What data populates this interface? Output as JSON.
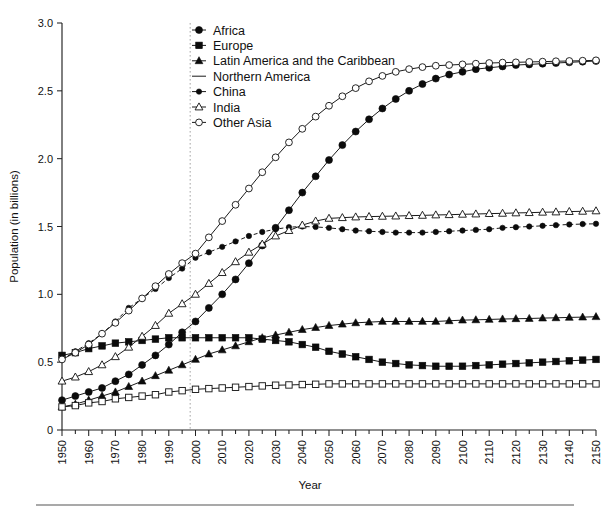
{
  "chart_data": {
    "type": "line",
    "title": "",
    "xlabel": "Year",
    "ylabel": "Population  (in billions)",
    "xlim": [
      1950,
      2150
    ],
    "ylim": [
      0,
      3.0
    ],
    "yticks": [
      "0",
      "0.5",
      "1.0",
      "1.5",
      "2.0",
      "2.5",
      "3.0"
    ],
    "ytick_values": [
      0,
      0.5,
      1.0,
      1.5,
      2.0,
      2.5,
      3.0
    ],
    "xticks": [
      "1950",
      "1960",
      "1970",
      "1980",
      "1990",
      "2000",
      "2010",
      "2020",
      "2030",
      "2040",
      "2050",
      "2060",
      "2070",
      "2080",
      "2090",
      "2100",
      "2110",
      "2120",
      "2130",
      "2140",
      "2150"
    ],
    "xtick_values": [
      1950,
      1960,
      1970,
      1980,
      1990,
      2000,
      2010,
      2020,
      2030,
      2040,
      2050,
      2060,
      2070,
      2080,
      2090,
      2100,
      2110,
      2120,
      2130,
      2140,
      2150
    ],
    "grid": false,
    "legend_position": "top-center",
    "annotations": [
      {
        "name": "projection-divider",
        "type": "vline",
        "x": 1998,
        "style": "dotted"
      }
    ],
    "x": [
      1950,
      1955,
      1960,
      1965,
      1970,
      1975,
      1980,
      1985,
      1990,
      1995,
      2000,
      2005,
      2010,
      2015,
      2020,
      2025,
      2030,
      2035,
      2040,
      2045,
      2050,
      2055,
      2060,
      2065,
      2070,
      2075,
      2080,
      2085,
      2090,
      2095,
      2100,
      2105,
      2110,
      2115,
      2120,
      2125,
      2130,
      2135,
      2140,
      2145,
      2150
    ],
    "series": [
      {
        "name": "Africa",
        "marker": "filled-circle",
        "line": "solid",
        "values": [
          0.22,
          0.25,
          0.28,
          0.31,
          0.36,
          0.41,
          0.48,
          0.55,
          0.63,
          0.72,
          0.8,
          0.9,
          1.0,
          1.11,
          1.23,
          1.36,
          1.49,
          1.62,
          1.75,
          1.87,
          1.99,
          2.1,
          2.2,
          2.29,
          2.37,
          2.44,
          2.5,
          2.55,
          2.59,
          2.62,
          2.64,
          2.66,
          2.67,
          2.68,
          2.69,
          2.695,
          2.7,
          2.705,
          2.71,
          2.715,
          2.72
        ]
      },
      {
        "name": "Europe",
        "marker": "filled-square",
        "line": "solid",
        "values": [
          0.55,
          0.57,
          0.6,
          0.62,
          0.64,
          0.65,
          0.66,
          0.67,
          0.68,
          0.68,
          0.68,
          0.68,
          0.68,
          0.68,
          0.68,
          0.67,
          0.66,
          0.65,
          0.63,
          0.61,
          0.58,
          0.56,
          0.54,
          0.52,
          0.5,
          0.49,
          0.48,
          0.475,
          0.47,
          0.47,
          0.47,
          0.475,
          0.48,
          0.485,
          0.49,
          0.495,
          0.5,
          0.505,
          0.51,
          0.515,
          0.52
        ]
      },
      {
        "name": "Latin America and the Caribbean",
        "marker": "filled-triangle",
        "line": "solid",
        "values": [
          0.17,
          0.19,
          0.22,
          0.25,
          0.28,
          0.32,
          0.36,
          0.4,
          0.44,
          0.48,
          0.52,
          0.56,
          0.59,
          0.62,
          0.65,
          0.68,
          0.7,
          0.72,
          0.74,
          0.755,
          0.77,
          0.78,
          0.79,
          0.795,
          0.8,
          0.8,
          0.8,
          0.8,
          0.8,
          0.805,
          0.81,
          0.812,
          0.815,
          0.818,
          0.82,
          0.822,
          0.825,
          0.827,
          0.83,
          0.832,
          0.835
        ]
      },
      {
        "name": "Northern America",
        "marker": "open-square",
        "line": "solid",
        "values": [
          0.17,
          0.18,
          0.2,
          0.21,
          0.23,
          0.24,
          0.25,
          0.26,
          0.28,
          0.29,
          0.3,
          0.305,
          0.31,
          0.315,
          0.32,
          0.325,
          0.33,
          0.332,
          0.335,
          0.337,
          0.34,
          0.34,
          0.34,
          0.34,
          0.34,
          0.34,
          0.34,
          0.34,
          0.34,
          0.34,
          0.34,
          0.34,
          0.34,
          0.34,
          0.34,
          0.34,
          0.34,
          0.34,
          0.34,
          0.34,
          0.34
        ]
      },
      {
        "name": "China",
        "marker": "small-filled-circle",
        "line": "dashed",
        "values": [
          0.52,
          0.58,
          0.64,
          0.71,
          0.8,
          0.9,
          0.97,
          1.04,
          1.12,
          1.19,
          1.27,
          1.31,
          1.35,
          1.39,
          1.43,
          1.46,
          1.48,
          1.495,
          1.5,
          1.497,
          1.49,
          1.48,
          1.47,
          1.465,
          1.46,
          1.455,
          1.455,
          1.455,
          1.46,
          1.465,
          1.47,
          1.475,
          1.48,
          1.49,
          1.495,
          1.5,
          1.505,
          1.51,
          1.515,
          1.518,
          1.52
        ]
      },
      {
        "name": "India",
        "marker": "open-triangle",
        "line": "solid",
        "values": [
          0.36,
          0.39,
          0.43,
          0.48,
          0.54,
          0.61,
          0.69,
          0.77,
          0.86,
          0.93,
          1.0,
          1.08,
          1.16,
          1.24,
          1.31,
          1.37,
          1.43,
          1.47,
          1.51,
          1.54,
          1.56,
          1.565,
          1.57,
          1.573,
          1.575,
          1.577,
          1.58,
          1.582,
          1.585,
          1.587,
          1.59,
          1.592,
          1.595,
          1.597,
          1.6,
          1.602,
          1.605,
          1.607,
          1.61,
          1.612,
          1.615
        ]
      },
      {
        "name": "Other Asia",
        "marker": "open-circle",
        "line": "solid",
        "values": [
          0.52,
          0.57,
          0.63,
          0.71,
          0.79,
          0.88,
          0.97,
          1.06,
          1.15,
          1.23,
          1.3,
          1.42,
          1.54,
          1.66,
          1.78,
          1.9,
          2.01,
          2.12,
          2.22,
          2.31,
          2.39,
          2.46,
          2.52,
          2.57,
          2.61,
          2.64,
          2.66,
          2.675,
          2.685,
          2.69,
          2.695,
          2.7,
          2.705,
          2.708,
          2.71,
          2.713,
          2.715,
          2.718,
          2.72,
          2.722,
          2.725
        ]
      }
    ]
  },
  "legend": {
    "entries": [
      {
        "label": "Africa",
        "marker": "filled-circle"
      },
      {
        "label": "Europe",
        "marker": "filled-square"
      },
      {
        "label": "Latin America and the Caribbean",
        "marker": "filled-triangle"
      },
      {
        "label": "Northern America",
        "marker": "plain-line"
      },
      {
        "label": "China",
        "marker": "small-filled-circle"
      },
      {
        "label": "India",
        "marker": "open-triangle"
      },
      {
        "label": "Other Asia",
        "marker": "open-circle"
      }
    ]
  },
  "colors": {
    "ink": "#111111",
    "axis": "#222222",
    "guide": "#9a9a9a",
    "background": "#ffffff"
  }
}
